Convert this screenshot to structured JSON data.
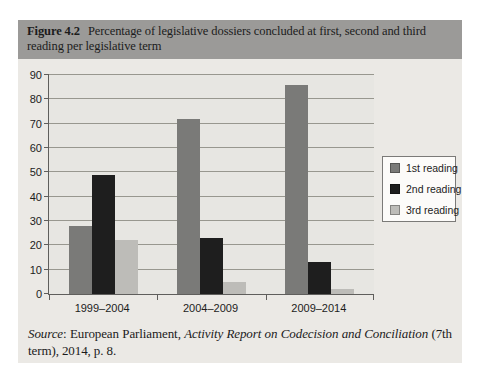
{
  "page": {
    "background": "#ffffff"
  },
  "figure": {
    "label": "Figure 4.2",
    "caption": "Percentage of legislative dossiers concluded at first, second and third reading per legislative term",
    "header_bg": "#9b9a98",
    "body_bg": "#ebe9e5",
    "source": {
      "label": "Source",
      "pre": ": European Parliament, ",
      "italic": "Activity Report on Codecision and Conciliation",
      "post": " (7th term), 2014, p. 8."
    }
  },
  "chart_data": {
    "type": "bar",
    "title": "Percentage of legislative dossiers concluded at first, second and third reading per legislative term",
    "categories": [
      "1999–2004",
      "2004–2009",
      "2009–2014"
    ],
    "series": [
      {
        "name": "1st reading",
        "color": "#7a7a78",
        "values": [
          28,
          72,
          86
        ]
      },
      {
        "name": "2nd reading",
        "color": "#1e1e1e",
        "values": [
          49,
          23,
          13
        ]
      },
      {
        "name": "3rd reading",
        "color": "#bdbcb8",
        "values": [
          22,
          5,
          2
        ]
      }
    ],
    "xlabel": "",
    "ylabel": "",
    "ylim": [
      0,
      90
    ],
    "yticks": [
      0,
      10,
      20,
      30,
      40,
      50,
      60,
      70,
      80,
      90
    ],
    "grid": true,
    "legend_position": "right",
    "plot_bg": "#e7e6e2",
    "gridline_color": "#98978f",
    "axis_color": "#5f5e5c"
  }
}
